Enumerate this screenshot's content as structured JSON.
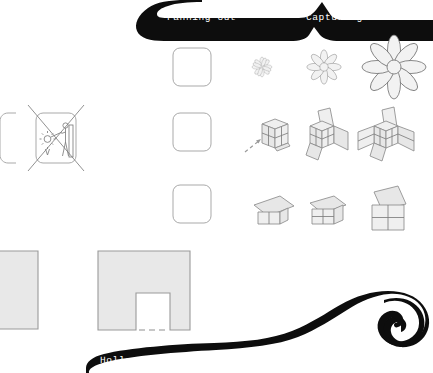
{
  "page": {
    "background_color": "#ffffff",
    "width": 433,
    "height": 373
  },
  "colors": {
    "ribbon": "#0d0d0d",
    "ribbon_text": "#ffffff",
    "line": "#6e6e6e",
    "line_dark": "#4a4a4a",
    "panel_fill": "#e6e6e6",
    "panel_fill_light": "#efefef",
    "facade_fill": "#e8e8e8",
    "facade_stroke": "#9a9a9a",
    "icon_stroke": "#8a8a8a"
  },
  "ribbons": [
    {
      "id": "ribbon-top",
      "label": "Fanning out",
      "label_name": "ribbon-label-fanning-out",
      "position": "top-left"
    },
    {
      "id": "ribbon-top-right",
      "label": "Capturing the sun",
      "label_name": "ribbon-label-capturing-the-sun",
      "position": "top-right"
    },
    {
      "id": "ribbon-bottom",
      "label": "Hollow oriel window",
      "label_name": "ribbon-label-hollow-oriel-window",
      "position": "bottom-left"
    }
  ],
  "icon_grid": {
    "rows": [
      {
        "name": "row-fanning-out",
        "placeholder": {
          "name": "placeholder-square-row1",
          "label": ""
        },
        "steps": [
          {
            "name": "flower-icon-small",
            "stage": 1,
            "label": ""
          },
          {
            "name": "flower-icon-medium",
            "stage": 2,
            "label": ""
          },
          {
            "name": "flower-icon-large",
            "stage": 3,
            "label": ""
          }
        ]
      },
      {
        "name": "row-cube-unfolding",
        "placeholder": {
          "name": "placeholder-square-row2",
          "label": ""
        },
        "steps": [
          {
            "name": "cube-icon-closed",
            "stage": 1,
            "label": ""
          },
          {
            "name": "cube-icon-half-open",
            "stage": 2,
            "label": ""
          },
          {
            "name": "cube-icon-unfolded",
            "stage": 3,
            "label": ""
          }
        ]
      },
      {
        "name": "row-canopy-box",
        "placeholder": {
          "name": "placeholder-square-row3",
          "label": ""
        },
        "steps": [
          {
            "name": "canopy-icon-flat",
            "stage": 1,
            "label": ""
          },
          {
            "name": "canopy-icon-tilted",
            "stage": 2,
            "label": ""
          },
          {
            "name": "canopy-icon-raised",
            "stage": 3,
            "label": ""
          }
        ]
      }
    ]
  },
  "left_icons": [
    {
      "name": "rounded-square-icon-cropped",
      "label": "",
      "crossed_out": false
    },
    {
      "name": "person-sun-icon-crossed-out",
      "label": "",
      "crossed_out": true
    }
  ],
  "facades": [
    {
      "name": "facade-elevation-left",
      "label": "",
      "has_opening": false
    },
    {
      "name": "facade-elevation-oriel",
      "label": "",
      "has_opening": true
    }
  ]
}
